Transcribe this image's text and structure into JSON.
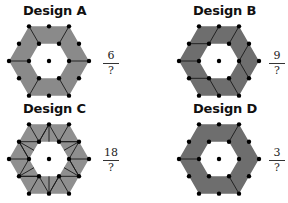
{
  "designs": [
    {
      "id": "A",
      "title": "Design A",
      "numerator": "6",
      "denominator": "?",
      "fill": "#8a8a8a"
    },
    {
      "id": "B",
      "title": "Design B",
      "numerator": "9",
      "denominator": "?",
      "fill": "#6e6e6e"
    },
    {
      "id": "C",
      "title": "Design C",
      "numerator": "18",
      "denominator": "?",
      "fill": "#8f8f8f"
    },
    {
      "id": "D",
      "title": "Design D",
      "numerator": "3",
      "denominator": "?",
      "fill": "#6e6e6e"
    }
  ],
  "colors": {
    "dot": "#000000",
    "line": "#1a1a1a",
    "background": "#ffffff"
  }
}
